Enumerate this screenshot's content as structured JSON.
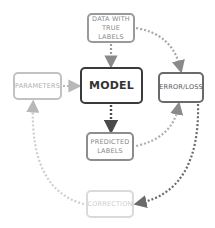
{
  "diagram": {
    "nodes": {
      "data": {
        "line1": "DATA WITH",
        "line2": "TRUE LABELS"
      },
      "model": {
        "label": "MODEL"
      },
      "parameters": {
        "label": "PARAMETERS"
      },
      "error": {
        "label": "ERROR/LOSS"
      },
      "predicted": {
        "line1": "PREDICTED",
        "line2": "LABELS"
      },
      "correction": {
        "label": "CORRECTION"
      }
    },
    "edges": [
      {
        "from": "DATA WITH TRUE LABELS",
        "to": "MODEL"
      },
      {
        "from": "DATA WITH TRUE LABELS",
        "to": "ERROR/LOSS"
      },
      {
        "from": "PARAMETERS",
        "to": "MODEL"
      },
      {
        "from": "MODEL",
        "to": "PREDICTED LABELS"
      },
      {
        "from": "PREDICTED LABELS",
        "to": "ERROR/LOSS"
      },
      {
        "from": "ERROR/LOSS",
        "to": "CORRECTION"
      },
      {
        "from": "CORRECTION",
        "to": "PARAMETERS"
      }
    ],
    "colors": {
      "model": "#3a3a3a",
      "error": "#6a6a6a",
      "data": "#9a9a9a",
      "predicted": "#8d8d8d",
      "parameters": "#c2c2c2",
      "correction": "#dadada"
    }
  }
}
